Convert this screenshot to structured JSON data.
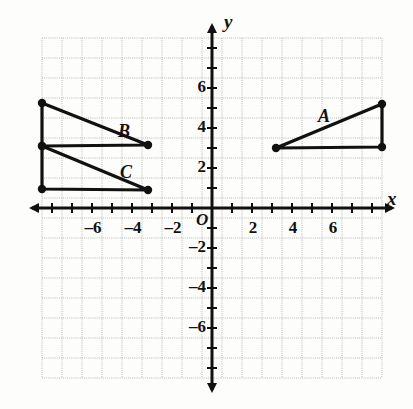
{
  "figure": {
    "kind": "coordinate-plane",
    "background_color": "#fdfdfb",
    "grid_color": "#b9b9b9",
    "axis_color": "#111111",
    "shape_color": "#111111"
  },
  "axes": {
    "x_axis_name": "x",
    "y_axis_name": "y",
    "origin_label": "O",
    "x_ticks": [
      {
        "value": -6,
        "label": "6",
        "minus": "–"
      },
      {
        "value": -4,
        "label": "4",
        "minus": "–"
      },
      {
        "value": -2,
        "label": "2",
        "minus": "–"
      },
      {
        "value": 2,
        "label": "2",
        "minus": ""
      },
      {
        "value": 4,
        "label": "4",
        "minus": ""
      },
      {
        "value": 6,
        "label": "6",
        "minus": ""
      }
    ],
    "y_ticks": [
      {
        "value": 6,
        "label": "6",
        "minus": ""
      },
      {
        "value": 4,
        "label": "4",
        "minus": ""
      },
      {
        "value": 2,
        "label": "2",
        "minus": ""
      },
      {
        "value": -2,
        "label": "2",
        "minus": "–"
      },
      {
        "value": -4,
        "label": "4",
        "minus": "–"
      },
      {
        "value": -6,
        "label": "6",
        "minus": "–"
      }
    ],
    "x_range": [
      -8.5,
      8.5
    ],
    "y_range": [
      -8.5,
      8.5
    ],
    "grid_step": 1
  },
  "chart_data": {
    "type": "scatter",
    "title": "",
    "xlabel": "x",
    "ylabel": "y",
    "xlim": [
      -8.5,
      8.5
    ],
    "ylim": [
      -8.5,
      8.5
    ],
    "grid": true,
    "legend": "none",
    "series": [
      {
        "name": "A",
        "label": "A",
        "label_position": {
          "x": 5.3,
          "y": 5.1
        },
        "closed": true,
        "points": [
          {
            "x": 3.2,
            "y": 3.0
          },
          {
            "x": 8.5,
            "y": 3.05
          },
          {
            "x": 8.5,
            "y": 5.2
          }
        ]
      },
      {
        "name": "B",
        "label": "B",
        "label_position": {
          "x": -4.7,
          "y": 4.35
        },
        "closed": true,
        "points": [
          {
            "x": -8.5,
            "y": 5.25
          },
          {
            "x": -3.2,
            "y": 3.15
          },
          {
            "x": -8.5,
            "y": 3.1
          }
        ]
      },
      {
        "name": "C",
        "label": "C",
        "label_position": {
          "x": -4.6,
          "y": 2.3
        },
        "closed": true,
        "points": [
          {
            "x": -8.5,
            "y": 3.1
          },
          {
            "x": -3.2,
            "y": 0.9
          },
          {
            "x": -8.5,
            "y": 0.95
          }
        ]
      }
    ],
    "vertex_marker": "filled-circle"
  }
}
